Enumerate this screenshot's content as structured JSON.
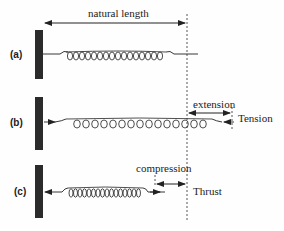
{
  "diagram": {
    "labels": {
      "natural_length": "natural length",
      "extension": "extension",
      "tension": "Tension",
      "compression": "compression",
      "thrust": "Thrust"
    },
    "panels": [
      {
        "id": "a",
        "label": "(a)",
        "state": "natural"
      },
      {
        "id": "b",
        "label": "(b)",
        "state": "stretched"
      },
      {
        "id": "c",
        "label": "(c)",
        "state": "compressed"
      }
    ],
    "colors": {
      "ink": "#222222",
      "wall": "#2b2b2b"
    }
  }
}
